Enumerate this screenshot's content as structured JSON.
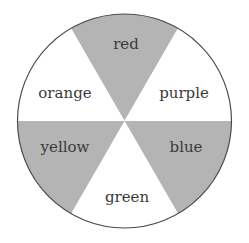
{
  "diagram": {
    "type": "color-wheel",
    "center": [
      124.5,
      121
    ],
    "radius": 107,
    "shaded_color": "#b4b4b4",
    "unshaded_color": "#ffffff",
    "outline_color": "#4a4a4a",
    "wedges": [
      {
        "label": "red",
        "shaded": true,
        "position": "top"
      },
      {
        "label": "purple",
        "shaded": false,
        "position": "upper-right"
      },
      {
        "label": "blue",
        "shaded": true,
        "position": "lower-right"
      },
      {
        "label": "green",
        "shaded": false,
        "position": "bottom"
      },
      {
        "label": "yellow",
        "shaded": true,
        "position": "lower-left"
      },
      {
        "label": "orange",
        "shaded": false,
        "position": "upper-left"
      }
    ]
  }
}
